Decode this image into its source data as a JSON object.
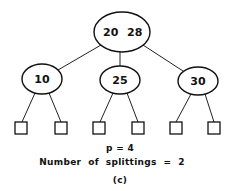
{
  "diagram": {
    "type": "b-tree",
    "root": {
      "keys": [
        "20",
        "28"
      ],
      "cx": 122,
      "cy": 32,
      "rx": 28,
      "ry": 20
    },
    "children": [
      {
        "key": "10",
        "cx": 42,
        "cy": 79,
        "rx": 20,
        "ry": 15
      },
      {
        "key": "25",
        "cx": 120,
        "cy": 80,
        "rx": 20,
        "ry": 14
      },
      {
        "key": "30",
        "cx": 198,
        "cy": 81,
        "rx": 20,
        "ry": 14
      }
    ],
    "leaves": [
      {
        "x": 15,
        "y": 122
      },
      {
        "x": 55,
        "y": 122
      },
      {
        "x": 93,
        "y": 122
      },
      {
        "x": 132,
        "y": 122
      },
      {
        "x": 170,
        "y": 122
      },
      {
        "x": 208,
        "y": 122
      }
    ],
    "leaf_size": 12
  },
  "captions": {
    "order": "p = 4",
    "splittings": "Number  of  splittings  =  2",
    "label": "(c)"
  }
}
